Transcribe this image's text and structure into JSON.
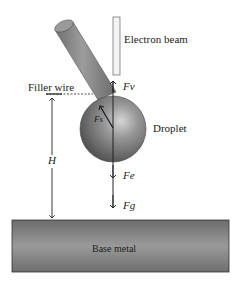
{
  "labels": {
    "electron_beam": "Electron beam",
    "filler_wire": "Filler wire",
    "droplet": "Droplet",
    "base_metal": "Base metal",
    "height": "H",
    "force_vapor": "Fv",
    "force_surface": "Fs",
    "force_electro": "Fe",
    "force_gravity": "Fg"
  },
  "colors": {
    "wire": "#8a8a8a",
    "droplet": "#7a7a7a",
    "base_metal": "#7d7d7d",
    "beam": "#f2f2f2",
    "line": "#222222"
  }
}
